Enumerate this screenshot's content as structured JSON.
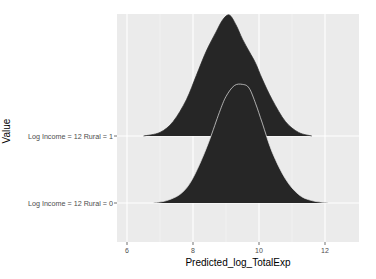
{
  "chart_data": {
    "type": "ridgeline-density",
    "title": "",
    "xlabel": "Predicted_log_TotalExp",
    "ylabel": "Value",
    "xlim": [
      5.7,
      13.0
    ],
    "x_ticks": [
      6,
      8,
      10,
      12
    ],
    "x_tick_labels": [
      "6",
      "8",
      "10",
      "12"
    ],
    "grid": true,
    "legend": "none",
    "categories": [
      "Log Income = 12 Rural = 0",
      "Log Income = 12 Rural = 1"
    ],
    "series": [
      {
        "name": "Log Income = 12 Rural = 0",
        "fill": "#262626",
        "outline": "#e8e8e8",
        "x": [
          6.8,
          7.2,
          7.6,
          7.9,
          8.2,
          8.5,
          8.8,
          9.0,
          9.25,
          9.5,
          9.7,
          9.9,
          10.1,
          10.4,
          10.8,
          11.2,
          11.6,
          12.1
        ],
        "density": [
          0.0,
          0.02,
          0.07,
          0.16,
          0.32,
          0.52,
          0.75,
          0.88,
          0.97,
          0.98,
          0.95,
          0.82,
          0.66,
          0.42,
          0.2,
          0.07,
          0.02,
          0.0
        ]
      },
      {
        "name": "Log Income = 12 Rural = 1",
        "fill": "#262626",
        "outline": "#262626",
        "x": [
          6.5,
          7.0,
          7.4,
          7.8,
          8.1,
          8.4,
          8.7,
          8.9,
          9.1,
          9.3,
          9.5,
          9.7,
          9.9,
          10.1,
          10.4,
          10.8,
          11.2,
          11.6
        ],
        "density": [
          0.0,
          0.03,
          0.12,
          0.3,
          0.5,
          0.7,
          0.86,
          0.96,
          1.0,
          0.92,
          0.8,
          0.7,
          0.6,
          0.47,
          0.3,
          0.12,
          0.03,
          0.0
        ]
      }
    ],
    "ridge_scale_px": 121
  },
  "axes": {
    "x_title": "Predicted_log_TotalExp",
    "y_title": "Value"
  }
}
